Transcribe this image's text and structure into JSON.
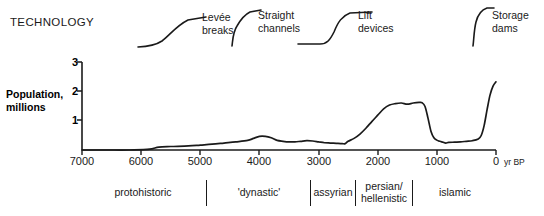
{
  "figure": {
    "technology_heading": "TECHNOLOGY",
    "y_axis_title_line1": "Population,",
    "y_axis_title_line2": "millions",
    "x_axis_unit": "yr BP"
  },
  "technology": {
    "items": [
      {
        "name": "levee-breaks",
        "label_line1": "Levée",
        "label_line2": "breaks"
      },
      {
        "name": "straight-channels",
        "label_line1": "Straight",
        "label_line2": "channels"
      },
      {
        "name": "lift-devices",
        "label_line1": "Lift",
        "label_line2": "devices"
      },
      {
        "name": "storage-dams",
        "label_line1": "Storage",
        "label_line2": "dams"
      }
    ]
  },
  "periods": [
    {
      "name": "protohistoric",
      "label_line1": "protohistoric",
      "label_line2": ""
    },
    {
      "name": "dynastic",
      "label_line1": "'dynastic'",
      "label_line2": ""
    },
    {
      "name": "assyrian",
      "label_line1": "assyrian",
      "label_line2": ""
    },
    {
      "name": "persian-hellenistic",
      "label_line1": "persian/",
      "label_line2": "hellenistic"
    },
    {
      "name": "islamic",
      "label_line1": "islamic",
      "label_line2": ""
    }
  ],
  "chart_data": {
    "type": "line",
    "title": "",
    "xlabel": "yr BP",
    "ylabel": "Population, millions",
    "xlim": [
      7000,
      0
    ],
    "ylim": [
      0,
      3
    ],
    "x_ticks": [
      7000,
      6000,
      5000,
      4000,
      3000,
      2000,
      1000,
      0
    ],
    "x_tick_labels": [
      "7000",
      "6000",
      "5000",
      "4000",
      "3000",
      "2000",
      "1000",
      "0"
    ],
    "y_ticks": [
      1,
      2,
      3
    ],
    "y_tick_labels": [
      "1",
      "2",
      "3"
    ],
    "x_axis_reversed": true,
    "grid": false,
    "legend": "none",
    "series": [
      {
        "name": "Population",
        "x": [
          7000,
          6600,
          6200,
          5900,
          5800,
          5700,
          5500,
          5200,
          5000,
          4800,
          4600,
          4400,
          4200,
          4100,
          4000,
          3900,
          3800,
          3700,
          3600,
          3500,
          3400,
          3300,
          3200,
          3100,
          3000,
          2900,
          2800,
          2700,
          2600,
          2550,
          2500,
          2400,
          2300,
          2200,
          2100,
          2000,
          1900,
          1800,
          1700,
          1600,
          1500,
          1400,
          1300,
          1250,
          1200,
          1150,
          1100,
          1050,
          1000,
          950,
          900,
          850,
          800,
          700,
          600,
          500,
          400,
          300,
          250,
          200,
          150,
          100,
          50,
          0
        ],
        "y": [
          0.0,
          0.0,
          0.0,
          0.02,
          0.05,
          0.1,
          0.12,
          0.14,
          0.17,
          0.2,
          0.24,
          0.28,
          0.33,
          0.4,
          0.47,
          0.47,
          0.42,
          0.33,
          0.3,
          0.28,
          0.28,
          0.3,
          0.32,
          0.31,
          0.28,
          0.25,
          0.24,
          0.23,
          0.22,
          0.22,
          0.3,
          0.4,
          0.55,
          0.75,
          0.98,
          1.2,
          1.42,
          1.55,
          1.6,
          1.62,
          1.58,
          1.62,
          1.64,
          1.63,
          1.5,
          1.1,
          0.65,
          0.42,
          0.34,
          0.3,
          0.27,
          0.24,
          0.26,
          0.27,
          0.28,
          0.3,
          0.32,
          0.38,
          0.5,
          0.85,
          1.4,
          1.9,
          2.2,
          2.35
        ]
      }
    ],
    "annotations": {
      "technology_curves": [
        "Levée breaks",
        "Straight channels",
        "Lift devices",
        "Storage dams"
      ],
      "period_bands": [
        "protohistoric",
        "'dynastic'",
        "assyrian",
        "persian/hellenistic",
        "islamic"
      ]
    }
  }
}
